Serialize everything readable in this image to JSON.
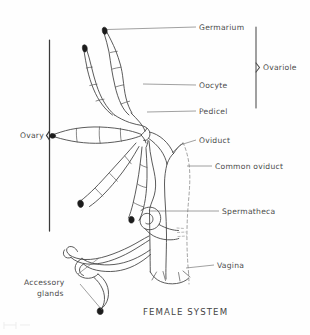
{
  "figure": {
    "title": "FEMALE SYSTEM"
  },
  "labels": {
    "germarium": "Germarium",
    "ovariole": "Ovariole",
    "oocyte": "Oocyte",
    "pedicel": "Pedicel",
    "oviduct": "Oviduct",
    "common_oviduct": "Common oviduct",
    "spermatheca": "Spermatheca",
    "vagina": "Vagina",
    "ovary": "Ovary",
    "accessory_glands_line1": "Accessory",
    "accessory_glands_line2": "glands"
  },
  "colors": {
    "background": "#fefefe",
    "ink": "#3d3d3d",
    "label_text": "#4a4a4a",
    "leader_line": "#6d6d6d",
    "hidden_outline": "#8a8a8a",
    "germarium_tip": "#1c1c1c"
  },
  "structures": {
    "ovariole_count": 5,
    "germarium_tip_count": 5,
    "accessory_gland_count": 2,
    "body_outline_style": "dashed"
  }
}
